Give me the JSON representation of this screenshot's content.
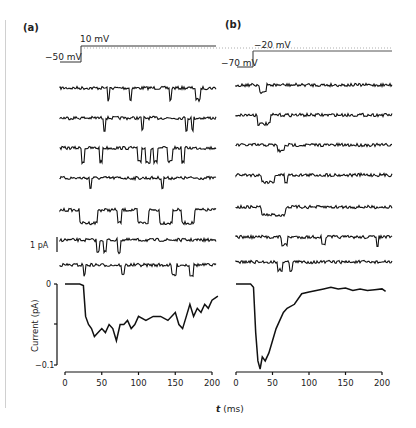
{
  "panels": {
    "a": {
      "label": "(a)",
      "v_hold": "−50 mV",
      "v_step": "10 mV"
    },
    "b": {
      "label": "(b)",
      "v_hold": "−70 mV",
      "v_step": "−20 mV"
    }
  },
  "scale_bar": "1 pA",
  "axes": {
    "ylabel": "Current (pA)",
    "yticks": [
      "0",
      "−0.1"
    ],
    "xticks": [
      "0",
      "50",
      "100",
      "150",
      "200"
    ],
    "xlabel_italic": "t",
    "xlabel_unit": "(ms)"
  },
  "chart_data": [
    {
      "type": "line",
      "title": "(a) Ensemble average current, step −50 mV → 10 mV",
      "xlabel": "t (ms)",
      "ylabel": "Current (pA)",
      "xlim": [
        0,
        200
      ],
      "ylim": [
        -0.1,
        0
      ],
      "x": [
        0,
        10,
        20,
        25,
        28,
        32,
        36,
        40,
        45,
        50,
        55,
        60,
        65,
        70,
        75,
        80,
        85,
        90,
        95,
        100,
        110,
        120,
        130,
        140,
        150,
        155,
        160,
        165,
        170,
        175,
        180,
        185,
        190,
        195,
        200,
        208
      ],
      "values": [
        0,
        0,
        0,
        -0.002,
        -0.04,
        -0.05,
        -0.055,
        -0.065,
        -0.06,
        -0.055,
        -0.06,
        -0.05,
        -0.055,
        -0.07,
        -0.05,
        -0.05,
        -0.045,
        -0.055,
        -0.05,
        -0.04,
        -0.045,
        -0.04,
        -0.04,
        -0.045,
        -0.035,
        -0.05,
        -0.055,
        -0.04,
        -0.025,
        -0.04,
        -0.03,
        -0.035,
        -0.025,
        -0.03,
        -0.02,
        -0.015
      ],
      "grid": false,
      "single_channel_sweeps": 7
    },
    {
      "type": "line",
      "title": "(b) Ensemble average current, step −70 mV → −20 mV",
      "xlabel": "t (ms)",
      "ylabel": "Current (pA)",
      "xlim": [
        0,
        200
      ],
      "ylim": [
        -0.1,
        0
      ],
      "x": [
        0,
        10,
        20,
        24,
        27,
        30,
        33,
        36,
        40,
        45,
        50,
        55,
        60,
        65,
        70,
        80,
        90,
        100,
        110,
        120,
        130,
        140,
        150,
        160,
        170,
        180,
        190,
        200,
        205
      ],
      "values": [
        0,
        0,
        0,
        -0.004,
        -0.06,
        -0.095,
        -0.105,
        -0.09,
        -0.095,
        -0.085,
        -0.07,
        -0.055,
        -0.045,
        -0.035,
        -0.03,
        -0.025,
        -0.012,
        -0.01,
        -0.008,
        -0.006,
        -0.004,
        -0.006,
        -0.005,
        -0.008,
        -0.006,
        -0.008,
        -0.007,
        -0.006,
        -0.009
      ],
      "grid": false,
      "single_channel_sweeps": 7
    }
  ]
}
